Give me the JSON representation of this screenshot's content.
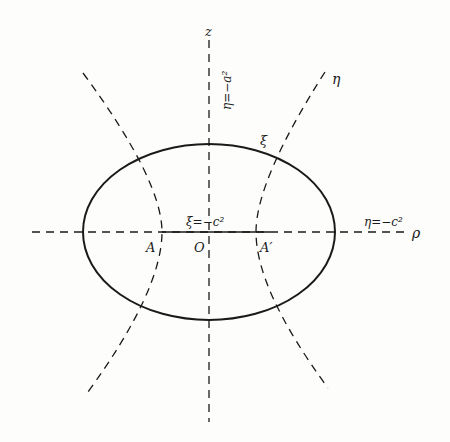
{
  "diagram": {
    "type": "prolate spheroidal coordinates cross-section",
    "labels": {
      "z_axis": "z",
      "rho_axis": "ρ",
      "eta_top": "η=−a²",
      "eta_curve": "η",
      "xi_curve": "ξ",
      "xi_focal": "ξ=−c²",
      "eta_axis": "η=−c²",
      "origin": "O",
      "focus_left": "A",
      "focus_right": "A′"
    },
    "colors": {
      "ink": "#1a1a1a",
      "paper": "#fdfdfb"
    }
  }
}
